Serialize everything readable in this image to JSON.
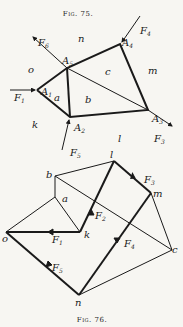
{
  "fig75": {
    "caption": "Fig. 75.",
    "nodes": {
      "A1": {
        "x": 37,
        "y": 90
      },
      "A2": {
        "x": 70,
        "y": 117
      },
      "A3": {
        "x": 148,
        "y": 110
      },
      "A4": {
        "x": 120,
        "y": 44
      },
      "A5": {
        "x": 67,
        "y": 68
      }
    },
    "regions": [
      "n",
      "o",
      "a",
      "b",
      "c",
      "m",
      "k",
      "l"
    ],
    "forces": [
      "F1",
      "F2",
      "F3",
      "F4",
      "F5",
      "F6"
    ]
  },
  "fig76": {
    "caption": "Fig. 76.",
    "points": [
      "l",
      "b",
      "a",
      "m",
      "o",
      "k",
      "c",
      "n"
    ],
    "forces": [
      "F1",
      "F2",
      "F3",
      "F4",
      "F5"
    ]
  },
  "labels": {
    "n": "n",
    "o": "o",
    "a": "a",
    "b": "b",
    "c": "c",
    "m": "m",
    "k": "k",
    "l": "l",
    "A": "A",
    "F": "F",
    "s1": "1",
    "s2": "2",
    "s3": "3",
    "s4": "4",
    "s5": "5",
    "s6": "6"
  }
}
